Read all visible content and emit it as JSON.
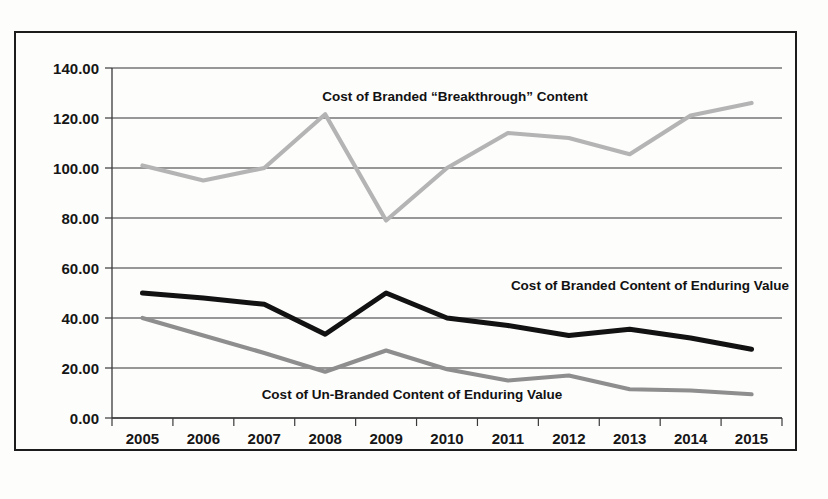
{
  "chart_data": {
    "type": "line",
    "title": "",
    "subtitle": "",
    "xlabel": "",
    "ylabel": "",
    "categories": [
      "2005",
      "2006",
      "2007",
      "2008",
      "2009",
      "2010",
      "2011",
      "2012",
      "2013",
      "2014",
      "2015"
    ],
    "ylim": [
      0,
      140
    ],
    "ytick_values": [
      0,
      20,
      40,
      60,
      80,
      100,
      120,
      140
    ],
    "ytick_labels": [
      "0.00",
      "20.00",
      "40.00",
      "60.00",
      "80.00",
      "100.00",
      "120.00",
      "140.00"
    ],
    "grid": true,
    "legend_position": "inline-annotations",
    "series": [
      {
        "name": "Cost of Branded “Breakthrough” Content",
        "color": "#b4b4b4",
        "values": [
          101,
          95,
          100,
          121.5,
          79,
          100,
          114,
          112,
          105.5,
          121,
          126
        ]
      },
      {
        "name": "Cost of Branded Content of Enduring Value",
        "color": "#121212",
        "values": [
          50,
          48,
          45.5,
          33.5,
          50,
          40,
          37,
          33,
          35.5,
          32,
          27.5
        ]
      },
      {
        "name": "Cost of Un-Branded Content of Enduring Value",
        "color": "#8e8e8e",
        "values": [
          40,
          33,
          26,
          18.5,
          27,
          19.5,
          15,
          17,
          11.5,
          11,
          9.5
        ]
      }
    ],
    "annotations": [
      {
        "text": "Cost of Branded “Breakthrough” Content",
        "x": 455,
        "y": 101
      },
      {
        "text": "Cost of Branded Content of Enduring Value",
        "x": 650,
        "y": 290
      },
      {
        "text": "Cost of Un-Branded Content of Enduring Value",
        "x": 412,
        "y": 399
      }
    ]
  },
  "axes": {
    "y_ticks": [
      {
        "label": "140.00",
        "value": 140
      },
      {
        "label": "120.00",
        "value": 120
      },
      {
        "label": "100.00",
        "value": 100
      },
      {
        "label": "80.00",
        "value": 80
      },
      {
        "label": "60.00",
        "value": 60
      },
      {
        "label": "40.00",
        "value": 40
      },
      {
        "label": "20.00",
        "value": 20
      },
      {
        "label": "0.00",
        "value": 0
      }
    ],
    "x_ticks": [
      "2005",
      "2006",
      "2007",
      "2008",
      "2009",
      "2010",
      "2011",
      "2012",
      "2013",
      "2014",
      "2015"
    ]
  },
  "colors": {
    "breakthrough": "#b4b4b4",
    "branded_enduring": "#121212",
    "unbranded_enduring": "#8e8e8e",
    "grid": "#333333",
    "frame": "#1c1c1c",
    "background": "#fdfdfc"
  }
}
